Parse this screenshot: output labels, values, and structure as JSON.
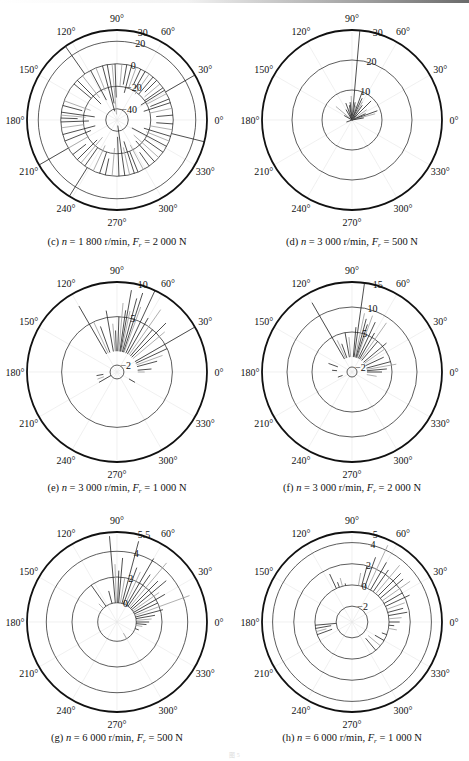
{
  "figure": {
    "footer_label": "图 5",
    "panels": [
      {
        "id": "c",
        "prefix": "(c)",
        "n": "1 800",
        "Fr": "2 000"
      },
      {
        "id": "d",
        "prefix": "(d)",
        "n": "3 000",
        "Fr": "500"
      },
      {
        "id": "e",
        "prefix": "(e)",
        "n": "3 000",
        "Fr": "1 000"
      },
      {
        "id": "f",
        "prefix": "(f)",
        "n": "3 000",
        "Fr": "2 000"
      },
      {
        "id": "g",
        "prefix": "(g)",
        "n": "6 000",
        "Fr": "500"
      },
      {
        "id": "h",
        "prefix": "(h)",
        "n": "6 000",
        "Fr": "1 000"
      }
    ],
    "caption_parts": {
      "n_symbol": "n",
      "eq": " = ",
      "unit_speed": " r/min, ",
      "F_symbol": "F",
      "F_sub": "r",
      "unit_force": " N"
    }
  },
  "chart_data": [
    {
      "type": "polar-stem",
      "panel": "c",
      "title": "(c) n = 1 800 r/min, Fr = 2 000 N",
      "angle_ticks": [
        "0°",
        "30°",
        "60°",
        "90°",
        "120°",
        "150°",
        "180°",
        "210°",
        "240°",
        "270°",
        "300°",
        "330°"
      ],
      "radial_ticks": [
        -40,
        -20,
        0,
        20,
        30
      ],
      "rlim": [
        -50,
        30
      ],
      "stems": [
        [
          92,
          -30
        ],
        [
          95,
          -45
        ],
        [
          100,
          -35
        ],
        [
          105,
          -42
        ],
        [
          112,
          -22
        ],
        [
          118,
          -30
        ],
        [
          125,
          30
        ],
        [
          128,
          -25
        ],
        [
          135,
          -30
        ],
        [
          140,
          -20
        ],
        [
          160,
          -25
        ],
        [
          165,
          -18
        ],
        [
          172,
          -30
        ],
        [
          175,
          -22
        ],
        [
          178,
          -15
        ],
        [
          182,
          -25
        ],
        [
          188,
          -20
        ],
        [
          195,
          -30
        ],
        [
          202,
          -25
        ],
        [
          210,
          -20
        ],
        [
          218,
          -15
        ],
        [
          225,
          -25
        ],
        [
          230,
          -30
        ],
        [
          235,
          -20
        ],
        [
          238,
          30
        ],
        [
          245,
          -25
        ],
        [
          252,
          -20
        ],
        [
          258,
          -15
        ],
        [
          265,
          -25
        ],
        [
          272,
          -35
        ],
        [
          278,
          -45
        ],
        [
          283,
          -25
        ],
        [
          288,
          -30
        ],
        [
          292,
          -20
        ],
        [
          298,
          -25
        ],
        [
          305,
          -15
        ],
        [
          312,
          -25
        ],
        [
          318,
          -30
        ],
        [
          325,
          -20
        ],
        [
          332,
          -35
        ],
        [
          338,
          -22
        ],
        [
          343,
          -25
        ],
        [
          346,
          30
        ],
        [
          350,
          -20
        ],
        [
          356,
          -15
        ],
        [
          5,
          -15
        ],
        [
          12,
          -20
        ],
        [
          18,
          -25
        ],
        [
          22,
          -18
        ],
        [
          28,
          -20
        ],
        [
          32,
          -25
        ],
        [
          35,
          -20
        ],
        [
          40,
          -18
        ],
        [
          45,
          -15
        ],
        [
          50,
          -20
        ],
        [
          55,
          -22
        ],
        [
          60,
          -18
        ],
        [
          65,
          -15
        ],
        [
          70,
          -20
        ],
        [
          75,
          -25
        ],
        [
          80,
          -18
        ],
        [
          85,
          -20
        ],
        [
          30,
          30
        ],
        [
          210,
          30
        ]
      ]
    },
    {
      "type": "polar-stem",
      "panel": "d",
      "title": "(d) n = 3 000 r/min, Fr = 500 N",
      "angle_ticks": [
        "0°",
        "30°",
        "60°",
        "90°",
        "120°",
        "150°",
        "180°",
        "210°",
        "240°",
        "270°",
        "300°",
        "330°"
      ],
      "radial_ticks": [
        10,
        20,
        30
      ],
      "rlim": [
        0,
        30
      ],
      "stems": [
        [
          85,
          30
        ],
        [
          92,
          8
        ],
        [
          96,
          6
        ],
        [
          100,
          5
        ],
        [
          105,
          4
        ],
        [
          110,
          6
        ],
        [
          120,
          4
        ],
        [
          140,
          7
        ],
        [
          150,
          3
        ],
        [
          80,
          6
        ],
        [
          75,
          5
        ],
        [
          70,
          10
        ],
        [
          65,
          8
        ],
        [
          60,
          7
        ],
        [
          55,
          6
        ],
        [
          45,
          9
        ],
        [
          35,
          6
        ],
        [
          25,
          5
        ],
        [
          20,
          9
        ],
        [
          15,
          8
        ],
        [
          10,
          4
        ],
        [
          200,
          2
        ]
      ]
    },
    {
      "type": "polar-stem",
      "panel": "e",
      "title": "(e) n = 3 000 r/min, Fr = 1 000 N",
      "angle_ticks": [
        "0°",
        "30°",
        "60°",
        "90°",
        "120°",
        "150°",
        "180°",
        "210°",
        "240°",
        "270°",
        "300°",
        "330°"
      ],
      "radial_ticks": [
        -2,
        5,
        10
      ],
      "rlim": [
        -3,
        10
      ],
      "stems": [
        [
          120,
          8
        ],
        [
          115,
          5
        ],
        [
          110,
          4
        ],
        [
          100,
          6
        ],
        [
          95,
          4
        ],
        [
          92,
          3
        ],
        [
          88,
          5
        ],
        [
          85,
          7
        ],
        [
          82,
          6
        ],
        [
          80,
          9
        ],
        [
          78,
          6
        ],
        [
          75,
          8
        ],
        [
          72,
          9
        ],
        [
          70,
          7
        ],
        [
          65,
          10
        ],
        [
          60,
          6
        ],
        [
          55,
          8
        ],
        [
          50,
          5
        ],
        [
          45,
          7
        ],
        [
          40,
          6
        ],
        [
          30,
          10
        ],
        [
          25,
          5
        ],
        [
          20,
          4
        ],
        [
          15,
          3
        ],
        [
          5,
          2
        ],
        [
          0,
          1
        ],
        [
          170,
          0
        ],
        [
          190,
          -1
        ],
        [
          200,
          -1
        ],
        [
          210,
          -2
        ],
        [
          330,
          -1
        ]
      ]
    },
    {
      "type": "polar-stem",
      "panel": "f",
      "title": "(f) n = 3 000 r/min, Fr = 2 000 N",
      "angle_ticks": [
        "0°",
        "30°",
        "60°",
        "90°",
        "120°",
        "150°",
        "180°",
        "210°",
        "240°",
        "270°",
        "300°",
        "330°"
      ],
      "radial_ticks": [
        -2,
        5,
        10,
        15
      ],
      "rlim": [
        -3,
        15
      ],
      "stems": [
        [
          120,
          13
        ],
        [
          115,
          4
        ],
        [
          110,
          3
        ],
        [
          100,
          5
        ],
        [
          95,
          4
        ],
        [
          85,
          6
        ],
        [
          82,
          15
        ],
        [
          78,
          9
        ],
        [
          75,
          8
        ],
        [
          72,
          7
        ],
        [
          70,
          9
        ],
        [
          65,
          8
        ],
        [
          60,
          6
        ],
        [
          55,
          9
        ],
        [
          50,
          5
        ],
        [
          40,
          6
        ],
        [
          35,
          5
        ],
        [
          25,
          4
        ],
        [
          15,
          5
        ],
        [
          10,
          6
        ],
        [
          5,
          4
        ],
        [
          0,
          3
        ],
        [
          350,
          2
        ],
        [
          160,
          2
        ],
        [
          175,
          1
        ],
        [
          190,
          0
        ],
        [
          200,
          -1
        ],
        [
          340,
          0
        ]
      ]
    },
    {
      "type": "polar-stem",
      "panel": "g",
      "title": "(g) n = 6 000 r/min, Fr = 500 N",
      "angle_ticks": [
        "0°",
        "30°",
        "60°",
        "90°",
        "120°",
        "150°",
        "180°",
        "210°",
        "240°",
        "270°",
        "300°",
        "330°"
      ],
      "radial_ticks": [
        0,
        2,
        4,
        5.5
      ],
      "rlim": [
        -1.5,
        5.5
      ],
      "stems": [
        [
          125,
          2
        ],
        [
          135,
          0.5
        ],
        [
          105,
          1
        ],
        [
          95,
          5.2
        ],
        [
          92,
          3
        ],
        [
          88,
          2.5
        ],
        [
          85,
          3.5
        ],
        [
          80,
          2
        ],
        [
          75,
          5
        ],
        [
          70,
          3
        ],
        [
          65,
          2.8
        ],
        [
          60,
          4.2
        ],
        [
          55,
          3
        ],
        [
          50,
          4.5
        ],
        [
          45,
          3
        ],
        [
          40,
          3.5
        ],
        [
          35,
          2.5
        ],
        [
          30,
          2.8
        ],
        [
          25,
          2
        ],
        [
          20,
          4.5
        ],
        [
          15,
          2.2
        ],
        [
          10,
          1.5
        ],
        [
          5,
          1.2
        ],
        [
          0,
          1
        ],
        [
          355,
          0.8
        ],
        [
          350,
          0.5
        ],
        [
          340,
          0.3
        ],
        [
          320,
          0
        ],
        [
          300,
          -0.5
        ]
      ]
    },
    {
      "type": "polar-stem",
      "panel": "h",
      "title": "(h) n = 6 000 r/min, Fr = 1 000 N",
      "angle_ticks": [
        "0°",
        "30°",
        "60°",
        "90°",
        "120°",
        "150°",
        "180°",
        "210°",
        "240°",
        "270°",
        "300°",
        "330°"
      ],
      "radial_ticks": [
        -2,
        0,
        2,
        4,
        5
      ],
      "rlim": [
        -3.5,
        5
      ],
      "stems": [
        [
          110,
          0.5
        ],
        [
          105,
          0.8
        ],
        [
          100,
          0.2
        ],
        [
          115,
          1.5
        ],
        [
          80,
          1.2
        ],
        [
          75,
          2
        ],
        [
          70,
          3
        ],
        [
          65,
          4.5
        ],
        [
          60,
          3
        ],
        [
          55,
          2.5
        ],
        [
          50,
          3.5
        ],
        [
          45,
          3
        ],
        [
          40,
          2.8
        ],
        [
          35,
          3.2
        ],
        [
          30,
          2
        ],
        [
          25,
          2.5
        ],
        [
          20,
          1.8
        ],
        [
          15,
          1.5
        ],
        [
          10,
          1.8
        ],
        [
          5,
          1.2
        ],
        [
          0,
          1
        ],
        [
          355,
          0.5
        ],
        [
          350,
          0.8
        ],
        [
          340,
          -0.5
        ],
        [
          330,
          -1
        ],
        [
          320,
          -1.5
        ],
        [
          310,
          -1.5
        ],
        [
          190,
          -1.5
        ],
        [
          195,
          -1
        ],
        [
          200,
          -1.5
        ],
        [
          185,
          -2
        ]
      ]
    }
  ]
}
